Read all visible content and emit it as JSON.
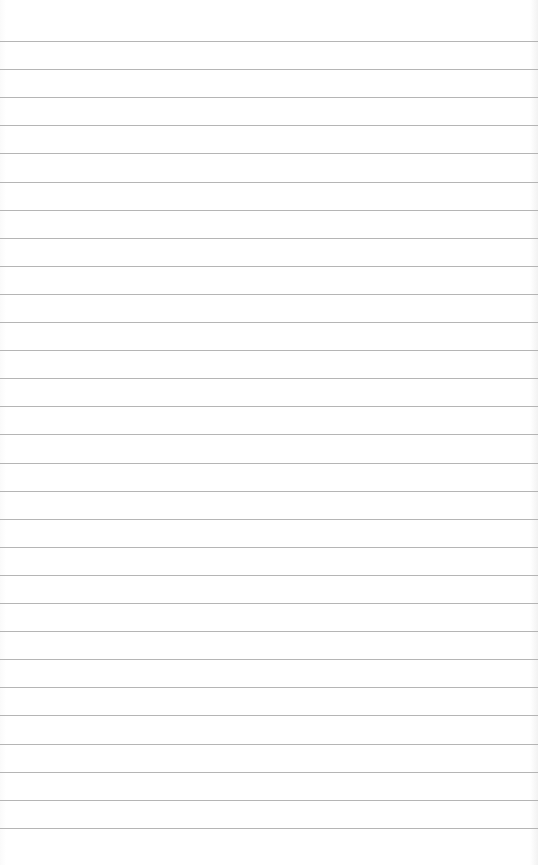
{
  "page": {
    "type": "ruled-paper",
    "background_color": "#ffffff",
    "rule_color": "#a8a8a8",
    "line_count": 29,
    "first_line_y": 41,
    "line_spacing": 28.1
  }
}
